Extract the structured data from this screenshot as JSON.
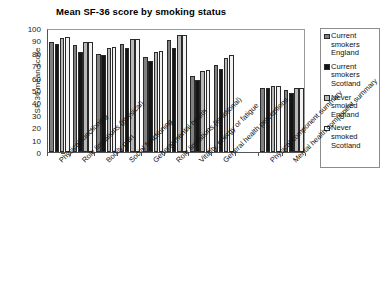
{
  "chart_data": {
    "type": "bar",
    "title": "Mean SF-36 score by smoking status",
    "xlabel": "",
    "ylabel": "SF-36 mean score",
    "ylim": [
      0,
      100
    ],
    "ytick_step": 10,
    "yticks": [
      "100",
      "90",
      "80",
      "70",
      "60",
      "50",
      "40",
      "30",
      "20",
      "10",
      "0"
    ],
    "grid": false,
    "legend_position": "right",
    "categories": [
      "Physical functioning",
      "Role limitations (physical)",
      "Bodily pain",
      "Social functioning",
      "General mental health",
      "Role limitations (emotional)",
      "Vitality, energy or fatigue",
      "General health perceptions",
      "",
      "Physical component summary",
      "Mental health component summary"
    ],
    "series": [
      {
        "name": "Current smokers England",
        "color": "#808080",
        "values": [
          89,
          86,
          79,
          87,
          77,
          90,
          61,
          70,
          null,
          51.5,
          50
        ]
      },
      {
        "name": "Current smokers Scotland",
        "color": "#151515",
        "values": [
          87,
          81,
          78,
          84,
          73,
          84,
          58,
          67,
          null,
          51.5,
          47.5
        ]
      },
      {
        "name": "Never smoked England",
        "color": "#b8b8b8",
        "values": [
          92,
          89,
          84,
          91,
          81,
          94,
          65,
          76,
          null,
          53,
          51.5
        ]
      },
      {
        "name": "Never smoked Scotland",
        "color": "#f2f2f2",
        "values": [
          93,
          89,
          85,
          91.5,
          81.5,
          94,
          66,
          78,
          null,
          53,
          52
        ]
      }
    ]
  },
  "legend": {
    "items": [
      {
        "label": "Current smokers England"
      },
      {
        "label": "Current smokers Scotland"
      },
      {
        "label": "Never smoked England"
      },
      {
        "label": "Never smoked Scotland"
      }
    ]
  }
}
